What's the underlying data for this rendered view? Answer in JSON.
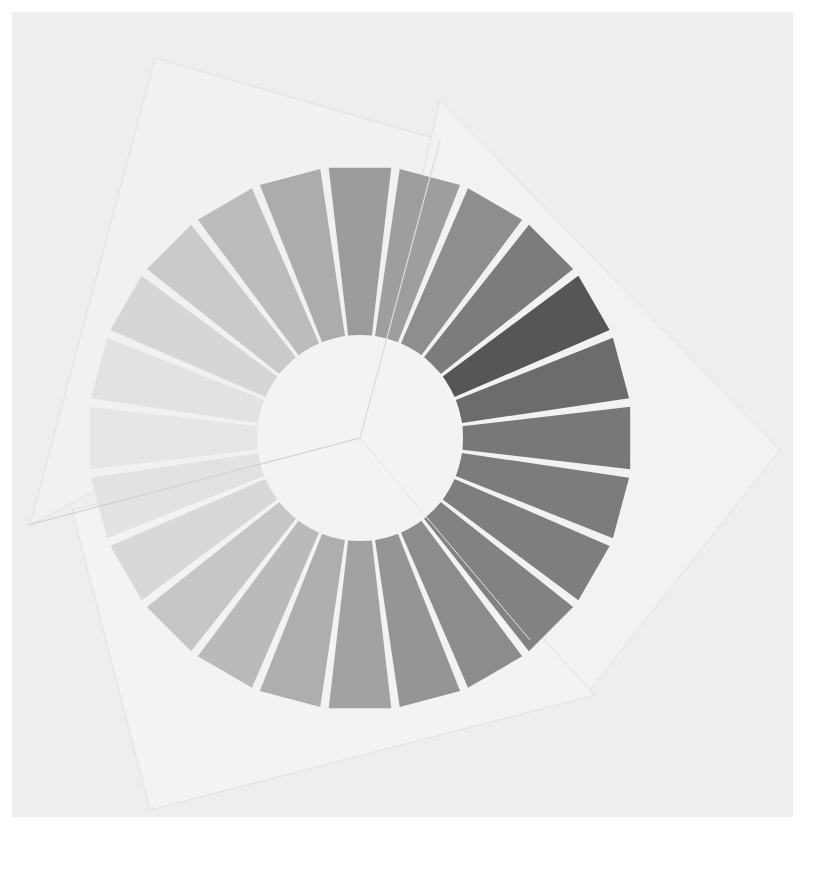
{
  "image": {
    "description": "Photograph of a grayscale color-wheel artwork: 24 radial wedges forming a ring on overlapping, rotated white paper sheets",
    "background": "#ffffff",
    "photo_area_color": "#efefef"
  },
  "wheel": {
    "center": [
      360,
      438
    ],
    "inner_radius": 103,
    "outer_radius": 272,
    "segment_count": 24,
    "gap_color": "#f4f4f4",
    "inner_disc_color": "#f3f3f3",
    "segments": [
      {
        "index": 0,
        "start_deg": -7.5,
        "color": "#9c9c9c"
      },
      {
        "index": 1,
        "start_deg": 7.5,
        "color": "#9e9e9e"
      },
      {
        "index": 2,
        "start_deg": 22.5,
        "color": "#8e8e8e"
      },
      {
        "index": 3,
        "start_deg": 37.5,
        "color": "#7c7c7c"
      },
      {
        "index": 4,
        "start_deg": 52.5,
        "color": "#565656"
      },
      {
        "index": 5,
        "start_deg": 67.5,
        "color": "#6c6c6c"
      },
      {
        "index": 6,
        "start_deg": 82.5,
        "color": "#787878"
      },
      {
        "index": 7,
        "start_deg": 97.5,
        "color": "#7c7c7c"
      },
      {
        "index": 8,
        "start_deg": 112.5,
        "color": "#7e7e7e"
      },
      {
        "index": 9,
        "start_deg": 127.5,
        "color": "#828282"
      },
      {
        "index": 10,
        "start_deg": 142.5,
        "color": "#8c8c8c"
      },
      {
        "index": 11,
        "start_deg": 157.5,
        "color": "#959595"
      },
      {
        "index": 12,
        "start_deg": 172.5,
        "color": "#a2a2a2"
      },
      {
        "index": 13,
        "start_deg": 187.5,
        "color": "#aeaeae"
      },
      {
        "index": 14,
        "start_deg": 202.5,
        "color": "#bababa"
      },
      {
        "index": 15,
        "start_deg": 217.5,
        "color": "#c6c6c6"
      },
      {
        "index": 16,
        "start_deg": 232.5,
        "color": "#d8d8d8"
      },
      {
        "index": 17,
        "start_deg": 247.5,
        "color": "#e2e2e2"
      },
      {
        "index": 18,
        "start_deg": 262.5,
        "color": "#e6e6e6"
      },
      {
        "index": 19,
        "start_deg": 277.5,
        "color": "#e2e2e2"
      },
      {
        "index": 20,
        "start_deg": 292.5,
        "color": "#d6d6d6"
      },
      {
        "index": 21,
        "start_deg": 307.5,
        "color": "#cacaca"
      },
      {
        "index": 22,
        "start_deg": 322.5,
        "color": "#bcbcbc"
      },
      {
        "index": 23,
        "start_deg": 337.5,
        "color": "#acacac"
      }
    ]
  },
  "paper_sheets": [
    {
      "name": "upper-left-sheet",
      "points": [
        [
          155,
          58
        ],
        [
          440,
          140
        ],
        [
          360,
          438
        ],
        [
          96,
          490
        ],
        [
          30,
          525
        ]
      ],
      "color": "#f1f1f1"
    },
    {
      "name": "right-sheet",
      "points": [
        [
          440,
          100
        ],
        [
          780,
          450
        ],
        [
          590,
          690
        ],
        [
          360,
          438
        ]
      ],
      "color": "#f2f2f2"
    },
    {
      "name": "lower-sheet",
      "points": [
        [
          72,
          510
        ],
        [
          360,
          438
        ],
        [
          590,
          690
        ],
        [
          595,
          695
        ],
        [
          150,
          810
        ]
      ],
      "color": "#f3f3f3"
    }
  ]
}
